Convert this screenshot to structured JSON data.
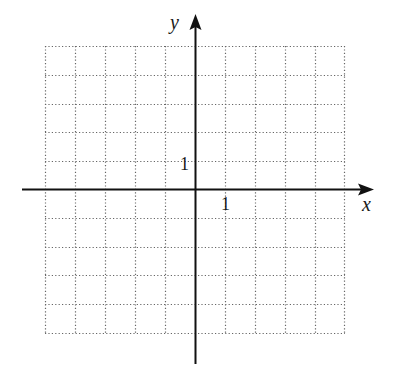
{
  "diagram": {
    "type": "coordinate-grid",
    "grid": {
      "x_min": -5,
      "x_max": 5,
      "y_min": -5,
      "y_max": 5,
      "cell_units": 1,
      "line_style": "dotted",
      "line_color": "#555555"
    },
    "axes": {
      "x_label": "x",
      "y_label": "y",
      "x_tick_label": "1",
      "y_tick_label": "1",
      "axis_color": "#111111"
    }
  }
}
